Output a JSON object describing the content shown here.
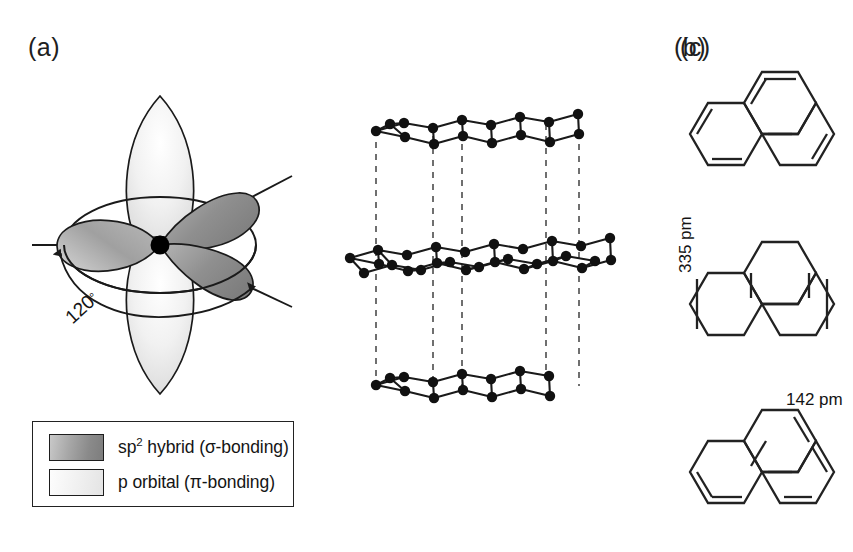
{
  "figure": {
    "background": "#ffffff",
    "line_color": "#1a1a1a"
  },
  "panels": {
    "a": {
      "label": "(a)",
      "name": "sp2-hybrid-orbital-diagram",
      "angle_label": "120",
      "angle_degree_symbol": "°",
      "colors": {
        "sp2_lobe_dark": "#8e8e8e",
        "sp2_lobe_light": "#bdbdbd",
        "p_orbital_light": "#ededed",
        "nucleus": "#000000",
        "outline": "#1a1a1a"
      },
      "elements": {
        "nucleus": "central-carbon-atom",
        "sp2_lobes": 3,
        "p_lobes": 2,
        "bond_lines": 3,
        "angle_arc": "120-degree-arc-with-arrowheads"
      }
    },
    "b": {
      "label": "(b)",
      "name": "graphite-layer-stacking-diagram",
      "interlayer_distance": "335 pm",
      "bond_distance": "142 pm",
      "layers": 3,
      "stacking": "AB",
      "colors": {
        "atom": "#111111",
        "bond": "#1a1a1a",
        "registry_dashed": "#333333"
      }
    },
    "c": {
      "label": "(c)",
      "name": "resonance-structures-panel",
      "structure_count": 3,
      "structures": [
        {
          "name": "resonance-structure-1",
          "description": "phenalene tri-hexagon with double bonds upper-left, left, lower-middle"
        },
        {
          "name": "resonance-structure-2",
          "description": "phenalene tri-hexagon with double bonds on upper-left, upper-right, left, right slanted edges"
        },
        {
          "name": "resonance-structure-3",
          "description": "phenalene tri-hexagon with double bonds upper-right, lower-left, lower-right and inner edges"
        }
      ],
      "colors": {
        "bond": "#222222"
      }
    }
  },
  "legend": {
    "name": "orbital-legend",
    "items": [
      {
        "swatch": "sp2-hybrid-swatch",
        "text_pre": "sp",
        "text_sup": "2",
        "text_post": " hybrid (σ-bonding)",
        "full_text": "sp2 hybrid (σ-bonding)",
        "color": "#8a8a8a"
      },
      {
        "swatch": "p-orbital-swatch",
        "text_pre": "p orbital (π-bonding)",
        "text_sup": "",
        "text_post": "",
        "full_text": "p orbital (π-bonding)",
        "color": "#efefef"
      }
    ]
  }
}
